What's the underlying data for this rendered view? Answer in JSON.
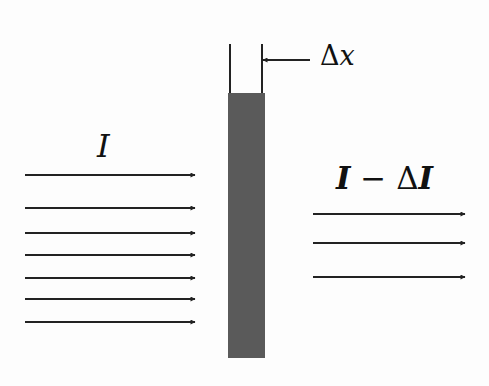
{
  "figure": {
    "labels": {
      "incident": "I",
      "thickness_delta": "Δ",
      "thickness_var": "x",
      "transmitted_I1": "I",
      "transmitted_minus": " − ",
      "transmitted_delta": "Δ",
      "transmitted_I2": "I"
    },
    "incident_arrows": {
      "count": 7,
      "x1": 25,
      "x2": 195,
      "y": [
        175,
        208,
        233,
        255,
        278,
        299,
        322
      ]
    },
    "transmitted_arrows": {
      "count": 3,
      "x1": 313,
      "x2": 465,
      "y": [
        214,
        243,
        277
      ]
    },
    "slab": {
      "x": 228,
      "y": 93,
      "width": 37,
      "height": 265,
      "color": "#5a5a5a"
    },
    "bracket": {
      "left_x": 230,
      "right_x": 262,
      "top_y": 44,
      "bottom_y": 93
    },
    "pointer_arrow": {
      "from_x": 310,
      "to_x": 263,
      "y": 60
    },
    "colors": {
      "line": "#222222",
      "slab": "#5a5a5a",
      "background": "#fdfdfd"
    }
  }
}
